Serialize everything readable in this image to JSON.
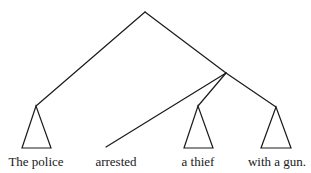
{
  "diagram": {
    "type": "syntax-tree",
    "nodes": {
      "root": {
        "x": 145,
        "y": 12
      },
      "vp": {
        "x": 226,
        "y": 73
      }
    },
    "branches": [
      {
        "name": "root-to-subject",
        "from": [
          145,
          12
        ],
        "to": [
          36,
          106
        ]
      },
      {
        "name": "root-to-vp",
        "from": [
          145,
          12
        ],
        "to": [
          226,
          73
        ]
      },
      {
        "name": "vp-to-verb",
        "from": [
          226,
          73
        ],
        "to": [
          106,
          147
        ]
      },
      {
        "name": "vp-to-object",
        "from": [
          226,
          73
        ],
        "to": [
          198,
          106
        ]
      },
      {
        "name": "vp-to-pp",
        "from": [
          226,
          73
        ],
        "to": [
          276,
          107
        ]
      }
    ],
    "triangles": [
      {
        "name": "subject-triangle",
        "apex": [
          36,
          106
        ],
        "left": [
          22,
          148
        ],
        "right": [
          51,
          148
        ]
      },
      {
        "name": "object-triangle",
        "apex": [
          198,
          106
        ],
        "left": [
          184,
          148
        ],
        "right": [
          213,
          148
        ]
      },
      {
        "name": "pp-triangle",
        "apex": [
          276,
          107
        ],
        "left": [
          261,
          148
        ],
        "right": [
          291,
          148
        ]
      }
    ],
    "leaves": [
      {
        "text": "The police",
        "x": 36
      },
      {
        "text": "arrested",
        "x": 116
      },
      {
        "text": "a thief",
        "x": 198
      },
      {
        "text": "with a gun.",
        "x": 277
      }
    ],
    "label_baseline": 166
  }
}
